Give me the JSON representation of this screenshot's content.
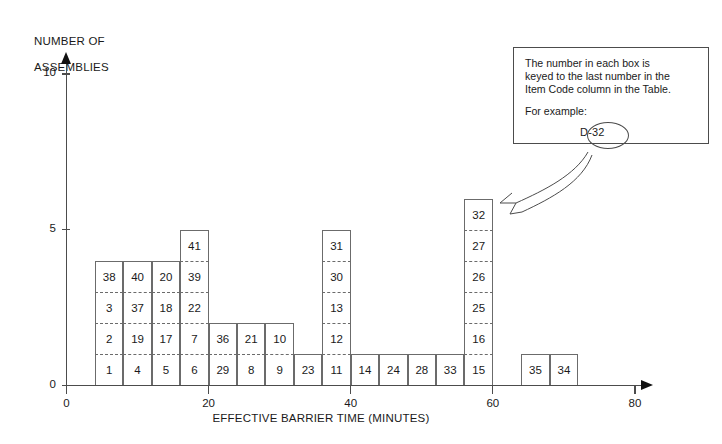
{
  "chart_data": {
    "type": "bar",
    "title": "",
    "xlabel": "EFFECTIVE BARRIER TIME (MINUTES)",
    "ylabel": "NUMBER OF\nASSEMBLIES",
    "xlim": [
      0,
      84
    ],
    "ylim": [
      0,
      10.6
    ],
    "x_ticks": [
      0,
      20,
      40,
      60,
      80
    ],
    "y_ticks": [
      0,
      5,
      10
    ],
    "grid": false,
    "legend": "none",
    "bin_width": 4,
    "note": "Each unit box is one assembly; the number inside each box is the last number of the Item Code.",
    "categories": [
      "4-8",
      "8-12",
      "12-16",
      "16-20",
      "20-24",
      "24-28",
      "28-32",
      "32-36",
      "36-40",
      "40-44",
      "44-48",
      "48-52",
      "52-56",
      "56-60",
      "60-64",
      "64-68",
      "68-72"
    ],
    "values": [
      4,
      4,
      4,
      5,
      2,
      2,
      2,
      1,
      5,
      1,
      1,
      1,
      1,
      6,
      0,
      1,
      1
    ],
    "columns": [
      {
        "bin_start": 4,
        "bin_end": 8,
        "count": 4,
        "items": [
          "1",
          "2",
          "3",
          "38"
        ]
      },
      {
        "bin_start": 8,
        "bin_end": 12,
        "count": 4,
        "items": [
          "4",
          "19",
          "37",
          "40"
        ]
      },
      {
        "bin_start": 12,
        "bin_end": 16,
        "count": 4,
        "items": [
          "5",
          "17",
          "18",
          "20"
        ]
      },
      {
        "bin_start": 16,
        "bin_end": 20,
        "count": 5,
        "items": [
          "6",
          "7",
          "22",
          "39",
          "41"
        ]
      },
      {
        "bin_start": 20,
        "bin_end": 24,
        "count": 2,
        "items": [
          "29",
          "36"
        ]
      },
      {
        "bin_start": 24,
        "bin_end": 28,
        "count": 2,
        "items": [
          "8",
          "21"
        ]
      },
      {
        "bin_start": 28,
        "bin_end": 32,
        "count": 2,
        "items": [
          "9",
          "10"
        ]
      },
      {
        "bin_start": 32,
        "bin_end": 36,
        "count": 1,
        "items": [
          "23"
        ]
      },
      {
        "bin_start": 36,
        "bin_end": 40,
        "count": 5,
        "items": [
          "11",
          "12",
          "13",
          "30",
          "31"
        ]
      },
      {
        "bin_start": 40,
        "bin_end": 44,
        "count": 1,
        "items": [
          "14"
        ]
      },
      {
        "bin_start": 44,
        "bin_end": 48,
        "count": 1,
        "items": [
          "24"
        ]
      },
      {
        "bin_start": 48,
        "bin_end": 52,
        "count": 1,
        "items": [
          "28"
        ]
      },
      {
        "bin_start": 52,
        "bin_end": 56,
        "count": 1,
        "items": [
          "33"
        ]
      },
      {
        "bin_start": 56,
        "bin_end": 60,
        "count": 6,
        "items": [
          "15",
          "16",
          "25",
          "26",
          "27",
          "32"
        ]
      },
      {
        "bin_start": 60,
        "bin_end": 64,
        "count": 0,
        "items": []
      },
      {
        "bin_start": 64,
        "bin_end": 68,
        "count": 1,
        "items": [
          "35"
        ]
      },
      {
        "bin_start": 68,
        "bin_end": 72,
        "count": 1,
        "items": [
          "34"
        ]
      }
    ]
  },
  "axes": {
    "y_title_line1": "NUMBER OF",
    "y_title_line2": "ASSEMBLIES",
    "x_title": "EFFECTIVE BARRIER TIME (MINUTES)",
    "y_tick_labels": [
      "0",
      "5",
      "10"
    ],
    "x_tick_labels": [
      "0",
      "20",
      "40",
      "60",
      "80"
    ]
  },
  "callout": {
    "line1": "The number in each box is",
    "line2": "keyed to the last number in the",
    "line3": "Item Code column in the Table.",
    "line4": "For example:",
    "example_code": "D-32",
    "highlight_part": "-32"
  },
  "colors": {
    "cell_stroke": "#6b6b6b",
    "axis": "#4c4c4c",
    "text": "#1a1a1a",
    "background": "#ffffff"
  }
}
